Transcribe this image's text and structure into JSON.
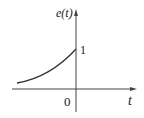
{
  "diagram": {
    "y_label": "e(t)",
    "x_label": "t",
    "origin_label": "0",
    "y_tick_label": "1",
    "curve": "exponential rising toward 1 at t=0 for t<0",
    "colors": {
      "line": "#333333",
      "axis": "#444444"
    }
  }
}
